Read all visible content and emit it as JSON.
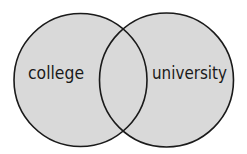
{
  "diagram": {
    "type": "venn",
    "sets": [
      {
        "label": "college",
        "cx": 80.5,
        "cy": 80,
        "r": 66.5
      },
      {
        "label": "university",
        "cx": 166.5,
        "cy": 80,
        "r": 67
      }
    ],
    "colors": {
      "fill": "#d9d9d9",
      "stroke": "#1a1a1a",
      "background": "#ffffff"
    }
  }
}
